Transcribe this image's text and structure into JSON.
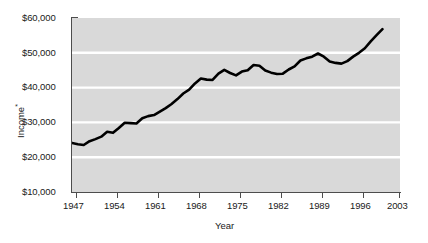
{
  "chart_data": {
    "type": "line",
    "title": "",
    "xlabel": "Year",
    "ylabel": "Income*",
    "ylabel_base": "Income",
    "ylabel_super": "*",
    "xlim": [
      1947,
      2003
    ],
    "ylim": [
      10000,
      60000
    ],
    "grid": true,
    "legend": "none",
    "xtick_labels": [
      "1947",
      "1954",
      "1961",
      "1968",
      "1975",
      "1982",
      "1989",
      "1996",
      "2003"
    ],
    "xtick_values": [
      1947,
      1954,
      1961,
      1968,
      1975,
      1982,
      1989,
      1996,
      2003
    ],
    "ytick_labels": [
      "$10,000",
      "$20,000",
      "$30,000",
      "$40,000",
      "$50,000",
      "$60,000"
    ],
    "ytick_values": [
      10000,
      20000,
      30000,
      40000,
      50000,
      60000
    ],
    "series": [
      {
        "name": "Median household income",
        "x": [
          1947,
          1948,
          1949,
          1950,
          1951,
          1952,
          1953,
          1954,
          1955,
          1956,
          1957,
          1958,
          1959,
          1960,
          1961,
          1962,
          1963,
          1964,
          1965,
          1966,
          1967,
          1968,
          1969,
          1970,
          1971,
          1972,
          1973,
          1974,
          1975,
          1976,
          1977,
          1978,
          1979,
          1980,
          1981,
          1982,
          1983,
          1984,
          1985,
          1986,
          1987,
          1988,
          1989,
          1990,
          1991,
          1992,
          1993,
          1994,
          1995,
          1996,
          1997,
          1998,
          1999,
          2000
        ],
        "values": [
          24100,
          23700,
          23500,
          24600,
          25200,
          25900,
          27300,
          27000,
          28400,
          29900,
          29800,
          29700,
          31200,
          31800,
          32100,
          33100,
          34100,
          35300,
          36700,
          38300,
          39400,
          41200,
          42600,
          42300,
          42200,
          44000,
          45100,
          44200,
          43500,
          44600,
          45000,
          46500,
          46300,
          44900,
          44300,
          43900,
          44000,
          45200,
          46100,
          47800,
          48400,
          48900,
          49800,
          48900,
          47500,
          47100,
          46900,
          47600,
          48900,
          50000,
          51300,
          53300,
          55100,
          56800
        ]
      }
    ]
  },
  "figure": {
    "line_color": "#000000",
    "plot_background": "#d9d9d9",
    "gridline_color": "#ffffff",
    "axis_color": "#555555"
  }
}
